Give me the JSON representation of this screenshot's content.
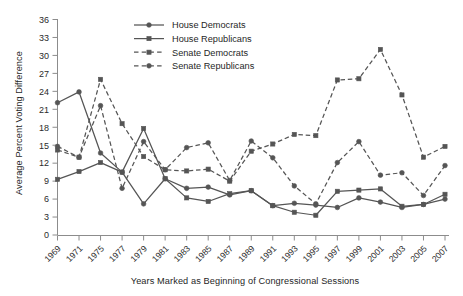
{
  "chart_data": {
    "type": "line",
    "title": "",
    "xlabel": "Years Marked as Beginning of Congressional Sessions",
    "ylabel": "Average Percent Voting Difference",
    "categories": [
      "1969",
      "1971",
      "1975",
      "1977",
      "1979",
      "1981",
      "1983",
      "1985",
      "1987",
      "1989",
      "1991",
      "1993",
      "1995",
      "1997",
      "1999",
      "2001",
      "2003",
      "2005",
      "2007"
    ],
    "ylim": [
      0,
      36
    ],
    "yticks": [
      0,
      3,
      6,
      9,
      12,
      15,
      18,
      21,
      24,
      27,
      30,
      33,
      36
    ],
    "grid": false,
    "legend_position": "top-center",
    "series": [
      {
        "name": "House Democrats",
        "style": "solid",
        "marker": "circle",
        "color": "#555555",
        "values": [
          22.1,
          23.9,
          13.7,
          10.5,
          5.2,
          9.4,
          7.8,
          8.0,
          6.7,
          7.4,
          4.9,
          5.3,
          5.0,
          4.6,
          6.2,
          5.5,
          4.6,
          5.1,
          6.0
        ]
      },
      {
        "name": "House Republicans",
        "style": "solid",
        "marker": "square",
        "color": "#555555",
        "values": [
          9.3,
          10.6,
          12.1,
          10.5,
          17.8,
          9.4,
          6.2,
          5.6,
          6.9,
          7.4,
          4.9,
          3.8,
          3.3,
          7.3,
          7.5,
          7.7,
          4.8,
          5.1,
          6.8
        ]
      },
      {
        "name": "Senate Democrats",
        "style": "dashed",
        "marker": "square",
        "color": "#555555",
        "values": [
          14.2,
          13.0,
          26.0,
          18.6,
          13.1,
          10.9,
          10.7,
          11.0,
          9.0,
          14.0,
          15.2,
          16.8,
          16.6,
          25.9,
          26.1,
          31.0,
          23.4,
          13.0,
          14.8
        ]
      },
      {
        "name": "Senate Republicans",
        "style": "dashed",
        "marker": "circle",
        "color": "#555555",
        "values": [
          14.8,
          13.0,
          21.6,
          7.8,
          15.6,
          10.9,
          14.6,
          15.4,
          9.1,
          15.7,
          12.9,
          8.2,
          5.2,
          12.1,
          15.6,
          10.0,
          10.4,
          6.6,
          11.6
        ]
      }
    ]
  },
  "legend": {
    "items": [
      {
        "label": "House Democrats"
      },
      {
        "label": "House Republicans"
      },
      {
        "label": "Senate Democrats"
      },
      {
        "label": "Senate Republicans"
      }
    ]
  }
}
